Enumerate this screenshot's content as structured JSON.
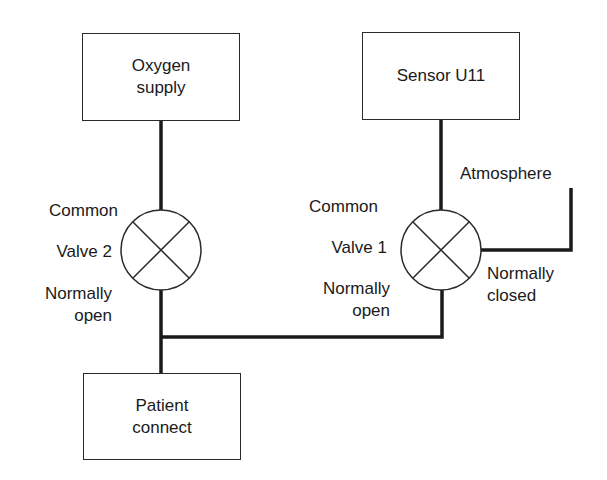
{
  "diagram": {
    "boxes": {
      "oxygen_supply": "Oxygen\nsupply",
      "sensor": "Sensor U11",
      "patient_connect": "Patient\nconnect"
    },
    "valve2": {
      "common_label": "Common",
      "name": "Valve 2",
      "port_label": "Normally\nopen"
    },
    "valve1": {
      "common_label": "Common",
      "name": "Valve 1",
      "port_label": "Normally\nopen",
      "closed_port_label": "Normally\nclosed"
    },
    "atmosphere_label": "Atmosphere",
    "colors": {
      "line": "#1a1a1a",
      "background": "#ffffff"
    }
  }
}
